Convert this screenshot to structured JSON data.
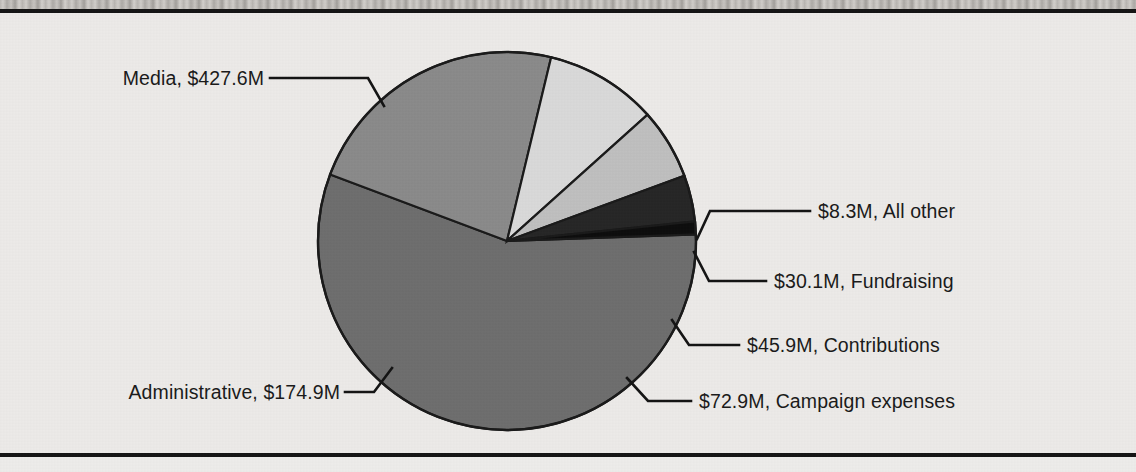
{
  "chart_data": {
    "type": "pie",
    "title": "",
    "subtitle": "",
    "xlabel": "",
    "ylabel": "",
    "units": "$ millions",
    "total": 759.7,
    "legend_position": "callout-labels",
    "grid": false,
    "categories": [
      "Media",
      "All other",
      "Fundraising",
      "Contributions",
      "Campaign expenses",
      "Administrative"
    ],
    "values": [
      427.6,
      8.3,
      30.1,
      45.9,
      72.9,
      174.9
    ],
    "labels": [
      "Media, $427.6M",
      "$8.3M, All other",
      "$30.1M, Fundraising",
      "$45.9M, Contributions",
      "$72.9M, Campaign expenses",
      "Administrative, $174.9M"
    ],
    "colors": [
      "#6e6e6e",
      "#0d0d0d",
      "#262626",
      "#bfbfbf",
      "#d9d9d9",
      "#8a8a8a"
    ],
    "slices": [
      {
        "name": "Media",
        "value": 427.6,
        "label": "Media, $427.6M",
        "color": "#6e6e6e",
        "percent": 56.3
      },
      {
        "name": "All other",
        "value": 8.3,
        "label": "$8.3M, All other",
        "color": "#0d0d0d",
        "percent": 1.1
      },
      {
        "name": "Fundraising",
        "value": 30.1,
        "label": "$30.1M, Fundraising",
        "color": "#262626",
        "percent": 4.0
      },
      {
        "name": "Contributions",
        "value": 45.9,
        "label": "$45.9M, Contributions",
        "color": "#bfbfbf",
        "percent": 6.0
      },
      {
        "name": "Campaign expenses",
        "value": 72.9,
        "label": "$72.9M, Campaign expenses",
        "color": "#d9d9d9",
        "percent": 9.6
      },
      {
        "name": "Administrative",
        "value": 174.9,
        "label": "Administrative, $174.9M",
        "color": "#8a8a8a",
        "percent": 23.0
      }
    ]
  },
  "figure": {
    "background_color": "#eceae8",
    "rule_color": "#151515",
    "outline_color": "#1a1a1a",
    "text_color": "#1a1a1a"
  },
  "callouts": {
    "media": "Media, $427.6M",
    "all_other": "$8.3M, All other",
    "fundraising": "$30.1M, Fundraising",
    "contributions": "$45.9M, Contributions",
    "campaign_expenses": "$72.9M, Campaign expenses",
    "administrative": "Administrative, $174.9M"
  }
}
